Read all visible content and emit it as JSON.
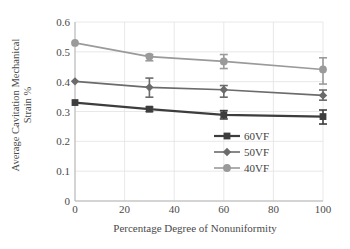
{
  "chart_data": {
    "type": "line",
    "title": "",
    "xlabel": "Percentage Degree of Nonuniformity",
    "ylabel": "Average Cavitation Mechanical Strain %",
    "ylabel_lines": [
      "Average Cavitation Mechanical",
      "Strain %"
    ],
    "xlim": [
      0,
      100
    ],
    "ylim": [
      0,
      0.6
    ],
    "xticks": [
      0,
      20,
      40,
      60,
      80,
      100
    ],
    "yticks": [
      0,
      0.1,
      0.2,
      0.3,
      0.4,
      0.5,
      0.6
    ],
    "xtick_labels": [
      "0",
      "20",
      "40",
      "60",
      "80",
      "100"
    ],
    "ytick_labels": [
      "0",
      "0.1",
      "0.2",
      "0.3",
      "0.4",
      "0.5",
      "0.6"
    ],
    "grid": "both-light",
    "legend_position": "inside-center-lower",
    "x": [
      0,
      30,
      60,
      100
    ],
    "series": [
      {
        "name": "60VF",
        "marker": "square",
        "color": "#3d3d3d",
        "values": [
          0.33,
          0.308,
          0.289,
          0.283
        ],
        "err_low": [
          null,
          0.3,
          0.275,
          0.258
        ],
        "err_high": [
          null,
          0.315,
          0.303,
          0.305
        ]
      },
      {
        "name": "50VF",
        "marker": "diamond",
        "color": "#6b6b6b",
        "values": [
          0.401,
          0.381,
          0.373,
          0.354
        ],
        "err_low": [
          null,
          0.348,
          0.348,
          0.338
        ],
        "err_high": [
          null,
          0.412,
          0.387,
          0.372
        ]
      },
      {
        "name": "40VF",
        "marker": "circle",
        "color": "#9a9a9a",
        "values": [
          0.53,
          0.484,
          0.468,
          0.441
        ],
        "err_low": [
          null,
          0.47,
          0.444,
          0.392
        ],
        "err_high": [
          null,
          0.491,
          0.491,
          0.48
        ]
      }
    ]
  },
  "legend": {
    "items": [
      {
        "label": "60VF"
      },
      {
        "label": "50VF"
      },
      {
        "label": "40VF"
      }
    ]
  }
}
